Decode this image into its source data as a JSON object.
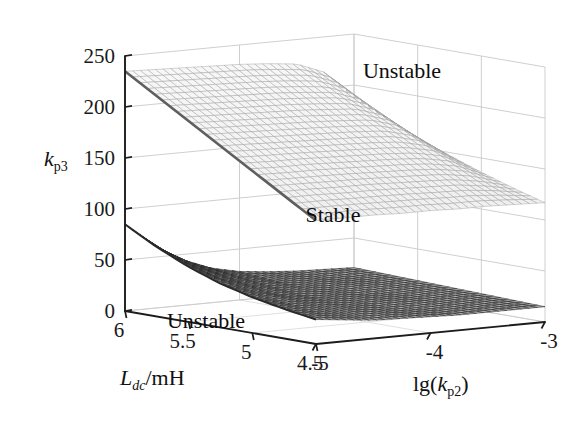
{
  "figure": {
    "background": "#ffffff",
    "axis_color": "#1c1c1c",
    "grid_color": "#c9c9c9"
  },
  "axes": {
    "z": {
      "title_main": "k",
      "title_sub": "p3",
      "ticks": [
        "250",
        "200",
        "150",
        "100",
        "50",
        "0"
      ],
      "values": [
        250,
        200,
        150,
        100,
        50,
        0
      ],
      "range": [
        0,
        250
      ]
    },
    "x": {
      "title_main": "L",
      "title_sub": "dc",
      "title_tail": "/mH",
      "ticks": [
        "6",
        "5.5",
        "5",
        "4.5"
      ],
      "values": [
        6,
        5.5,
        5,
        4.5
      ],
      "range": [
        6,
        4.5
      ]
    },
    "y": {
      "title_pre": "lg(",
      "title_main": "k",
      "title_sub": "p2",
      "title_post": ")",
      "ticks": [
        "-5",
        "-4",
        "-3"
      ],
      "values": [
        -5,
        -4,
        -3
      ],
      "range": [
        -5,
        -3
      ]
    }
  },
  "annotations": [
    {
      "name": "unstable-upper",
      "text": "Unstable",
      "x": 402,
      "y": 78
    },
    {
      "name": "stable-middle",
      "text": "Stable",
      "x": 333,
      "y": 222
    },
    {
      "name": "unstable-lower",
      "text": "Unstable",
      "x": 206,
      "y": 328
    }
  ],
  "chart_data": {
    "type": "surface",
    "title": "",
    "xlabel": "L_dc/mH",
    "ylabel": "lg(k_p2)",
    "zlabel": "k_p3",
    "xlim": [
      6,
      4.5
    ],
    "ylim": [
      -5,
      -3
    ],
    "zlim": [
      0,
      250
    ],
    "grid": true,
    "legend": "none",
    "surfaces": [
      {
        "name": "upper-boundary",
        "label": "upper stability boundary",
        "color": "#dcdcdc",
        "edge_color": "#b8b8b8",
        "description": "Upper surface separating Stable (below) from Unstable (above); tilts down from kp3~235 at Ldc=6, lg(kp2)=-5 toward kp3~120 at Ldc=4.5 and drops toward kp3~135 at lg(kp2)=-3.",
        "x": [
          6.0,
          5.75,
          5.5,
          5.25,
          5.0,
          4.75,
          4.5
        ],
        "y": [
          -5.0,
          -4.75,
          -4.5,
          -4.25,
          -4.0,
          -3.75,
          -3.5,
          -3.25,
          -3.0
        ],
        "z": [
          [
            235,
            234,
            233,
            232,
            231,
            229,
            226,
            215,
            186
          ],
          [
            216,
            215,
            214,
            213,
            212,
            210,
            207,
            197,
            172
          ],
          [
            197,
            196,
            195,
            194,
            193,
            191,
            189,
            180,
            159
          ],
          [
            178,
            177,
            176,
            175,
            174,
            173,
            171,
            164,
            147
          ],
          [
            159,
            158,
            158,
            157,
            156,
            155,
            153,
            148,
            136
          ],
          [
            140,
            140,
            139,
            139,
            138,
            137,
            136,
            132,
            126
          ],
          [
            121,
            121,
            121,
            120,
            120,
            119,
            119,
            118,
            117
          ]
        ]
      },
      {
        "name": "lower-boundary",
        "label": "lower stability boundary",
        "color": "#6e6e6e",
        "edge_color": "#3a3a3a",
        "description": "Lower surface separating Unstable (below) from Stable (above); starts at kp3~85 at Ldc=6, lg(kp2)=-5, falls steeply to a near-flat sheet around kp3~12-25.",
        "x": [
          6.0,
          5.75,
          5.5,
          5.25,
          5.0,
          4.75,
          4.5
        ],
        "y": [
          -5.0,
          -4.75,
          -4.5,
          -4.25,
          -4.0,
          -3.75,
          -3.5,
          -3.25,
          -3.0
        ],
        "z": [
          [
            85,
            62,
            45,
            34,
            28,
            25,
            23,
            22,
            21
          ],
          [
            68,
            50,
            38,
            30,
            25,
            23,
            21,
            20,
            20
          ],
          [
            54,
            41,
            32,
            26,
            23,
            21,
            20,
            19,
            19
          ],
          [
            43,
            34,
            27,
            23,
            21,
            19,
            18,
            18,
            18
          ],
          [
            35,
            28,
            24,
            21,
            19,
            18,
            17,
            17,
            17
          ],
          [
            29,
            24,
            21,
            19,
            17,
            16,
            16,
            16,
            16
          ],
          [
            24,
            21,
            18,
            17,
            16,
            15,
            15,
            15,
            15
          ]
        ]
      }
    ],
    "regions": [
      {
        "label": "Unstable",
        "position": "above upper surface"
      },
      {
        "label": "Stable",
        "position": "between the two surfaces"
      },
      {
        "label": "Unstable",
        "position": "below lower surface"
      }
    ]
  }
}
